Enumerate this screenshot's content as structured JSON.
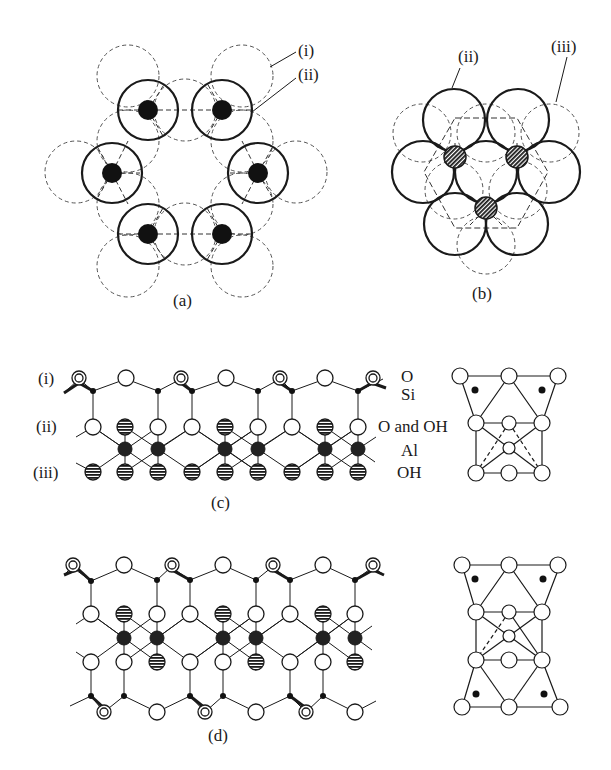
{
  "figure": {
    "panels": {
      "a": {
        "caption": "(a)",
        "labels": [
          "(i)",
          "(ii)"
        ],
        "description": "Hexagonal ring of tetrahedral Si sites (solid circles with black dots) surrounded by oxygen (dashed circles)"
      },
      "b": {
        "caption": "(b)",
        "labels": [
          "(ii)",
          "(iii)"
        ],
        "description": "Close-packed layer of solid circles with hatched Al sites and dashed third layer"
      },
      "c": {
        "caption": "(c)",
        "row_labels": [
          "(i)",
          "(ii)",
          "(iii)"
        ],
        "species_labels": [
          "O",
          "Si",
          "O and OH",
          "Al",
          "OH"
        ],
        "description": "Side view of 1:1 layer silicate (kaolinite-type) structure"
      },
      "d": {
        "caption": "(d)",
        "description": "Side view of 2:1 layer silicate (pyrophyllite-type) structure"
      }
    },
    "colors": {
      "ink": "#1a1a1a",
      "dashed": "#555555",
      "background": "#ffffff"
    }
  }
}
